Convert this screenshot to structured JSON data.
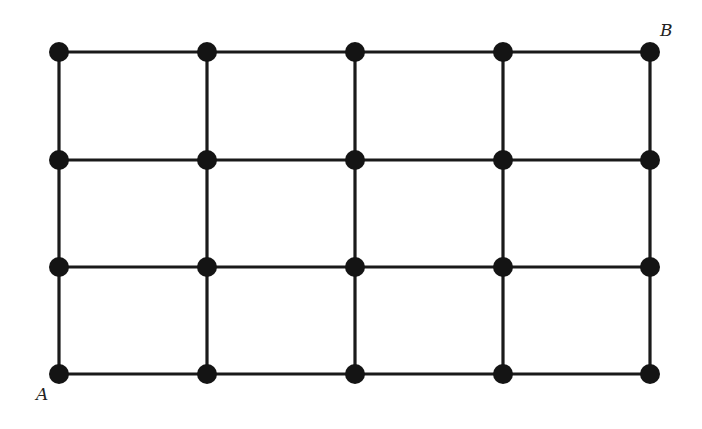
{
  "diagram": {
    "type": "grid-graph",
    "columns_x": [
      59,
      207,
      355,
      503,
      650
    ],
    "rows_y": [
      52,
      160,
      267,
      374
    ],
    "node_radius": 10,
    "colors": {
      "edge": "#1a1a1a",
      "node": "#141414",
      "label": "#222222"
    },
    "labels": [
      {
        "id": "A",
        "text": "A",
        "x": 36,
        "y": 400
      },
      {
        "id": "B",
        "text": "B",
        "x": 660,
        "y": 36
      }
    ]
  }
}
